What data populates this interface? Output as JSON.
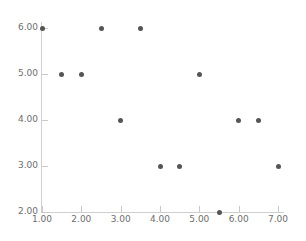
{
  "chart_data": {
    "type": "scatter",
    "title": "",
    "subtitle": "",
    "xlabel": "",
    "ylabel": "",
    "xlim": [
      1.0,
      7.0
    ],
    "ylim": [
      2.0,
      6.0
    ],
    "grid": false,
    "legend": null,
    "marker_color": "#555555",
    "axis_color": "#cfcfcf",
    "tick_label_color": "#6e6e6e",
    "background_color": "#ffffff",
    "xticks": [
      1.0,
      2.0,
      3.0,
      4.0,
      5.0,
      6.0,
      7.0
    ],
    "yticks": [
      2.0,
      3.0,
      4.0,
      5.0,
      6.0
    ],
    "xtick_labels": [
      "1.00",
      "2.00",
      "3.00",
      "4.00",
      "5.00",
      "6.00",
      "7.00"
    ],
    "ytick_labels": [
      "2.00",
      "3.00",
      "4.00",
      "5.00",
      "6.00"
    ],
    "points": [
      {
        "x": 1.0,
        "y": 6.0
      },
      {
        "x": 2.5,
        "y": 6.0
      },
      {
        "x": 3.5,
        "y": 6.0
      },
      {
        "x": 1.5,
        "y": 5.0
      },
      {
        "x": 2.0,
        "y": 5.0
      },
      {
        "x": 5.0,
        "y": 5.0
      },
      {
        "x": 3.0,
        "y": 4.0
      },
      {
        "x": 6.0,
        "y": 4.0
      },
      {
        "x": 6.5,
        "y": 4.0
      },
      {
        "x": 4.0,
        "y": 3.0
      },
      {
        "x": 4.5,
        "y": 3.0
      },
      {
        "x": 7.0,
        "y": 3.0
      },
      {
        "x": 5.5,
        "y": 2.0
      }
    ]
  }
}
